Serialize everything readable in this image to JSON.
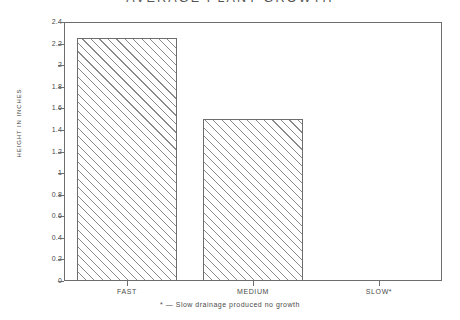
{
  "chart_data": {
    "type": "bar",
    "title": "AVERAGE PLANT GROWTH",
    "xlabel": "",
    "ylabel": "HEIGHT IN INCHES",
    "categories": [
      "FAST",
      "MEDIUM",
      "SLOW*"
    ],
    "values": [
      2.25,
      1.5,
      0
    ],
    "ylim": [
      0,
      2.4
    ],
    "ytick_labels": [
      "2.4",
      "2.2",
      "2",
      "1.8",
      "1.6",
      "1.4",
      "1.2",
      "1",
      "0.8",
      "0.6",
      "0.4",
      "0.2",
      "0"
    ],
    "ytick_values": [
      2.4,
      2.2,
      2.0,
      1.8,
      1.6,
      1.4,
      1.2,
      1.0,
      0.8,
      0.6,
      0.4,
      0.2,
      0
    ],
    "grid": false,
    "legend": "none",
    "annotation": "* — Slow drainage produced no growth",
    "series": [
      {
        "name": "Average plant growth",
        "values": [
          2.25,
          1.5,
          0
        ]
      }
    ],
    "bar_style": {
      "fill": "#ffffff",
      "hatch": "diagonal-45",
      "hatch_color": "#8a8a8a",
      "edge_color": "#6d6d6d"
    }
  },
  "axes": {
    "frame_color": "#6d6d6d",
    "text_color": "#4a4a4a"
  }
}
